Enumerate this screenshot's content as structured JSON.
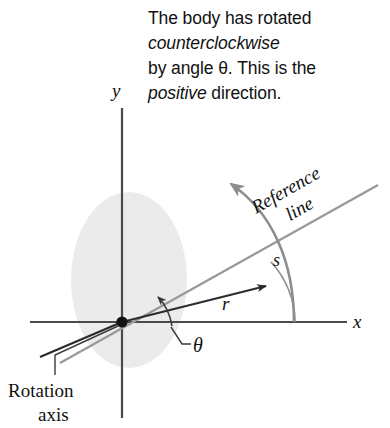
{
  "figure": {
    "title_caption": {
      "lines": [
        {
          "pre": "The body has rotated",
          "italic": "",
          "post": ""
        },
        {
          "pre": "",
          "italic": "counterclockwise",
          "post": ""
        },
        {
          "pre": "by angle θ. This is the",
          "italic": "",
          "post": ""
        },
        {
          "pre": "",
          "italic": "positive",
          "post": " direction."
        }
      ]
    },
    "axes": {
      "x_label": "x",
      "y_label": "y"
    },
    "labels": {
      "radius": "r",
      "arc_length": "s",
      "angle": "θ",
      "reference_line_word1": "Reference",
      "reference_line_word2": "line",
      "rotation_axis_line1": "Rotation",
      "rotation_axis_line2": "axis"
    },
    "colors": {
      "body_disk": "#ebebeb",
      "axis_line": "#4a4a4a",
      "reference_line": "#9a9a9a",
      "rotation_arrow": "#8d8d8d",
      "radius_line": "#2b2b2b",
      "arc_line": "#8d8d8d",
      "text": "#111111"
    }
  }
}
